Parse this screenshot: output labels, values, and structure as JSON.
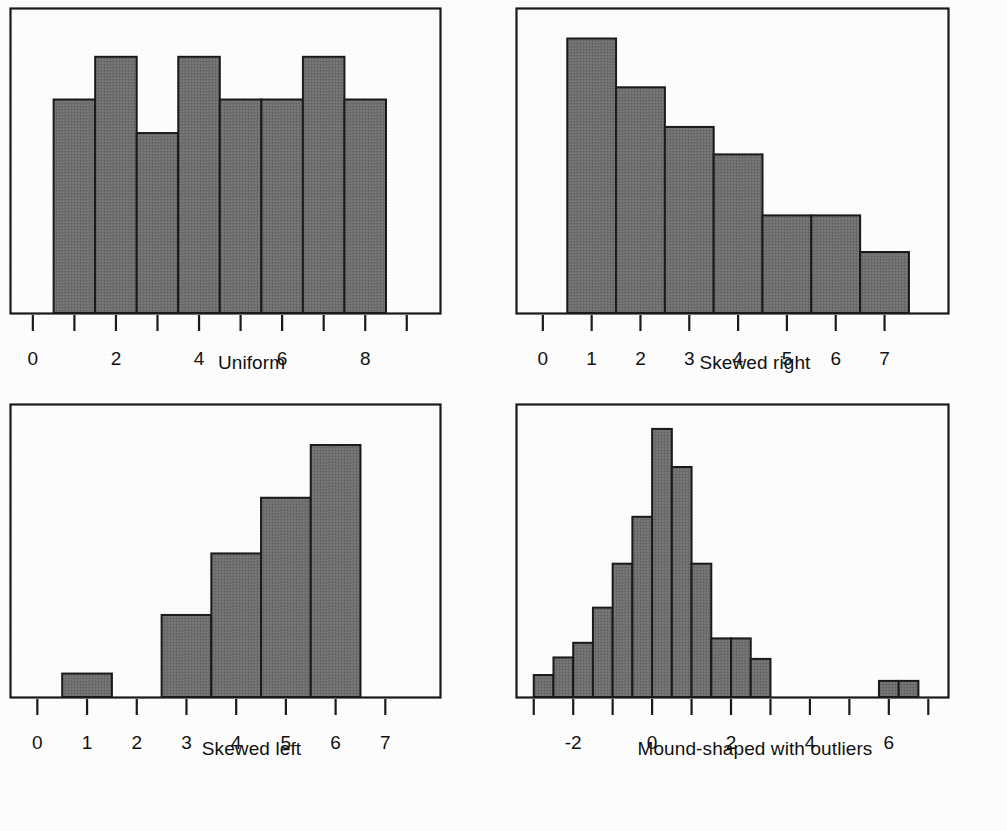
{
  "figure": {
    "background_color": "#fdfdfd",
    "bar_fill_color": "#6e6e6e",
    "bar_stroke_color": "#1a1a1a",
    "axis_color": "#1a1a1a"
  },
  "panels": [
    {
      "id": "uniform",
      "caption": "Uniform",
      "chart_data": {
        "type": "bar",
        "title": "Uniform",
        "xlabel": "Uniform",
        "ylabel": "",
        "xlim": [
          -0.55,
          9.8
        ],
        "ylim": [
          0,
          10
        ],
        "grid": false,
        "legend": "none",
        "bin_width": 1,
        "tick_values": [
          0,
          1,
          2,
          3,
          4,
          5,
          6,
          7,
          8,
          9
        ],
        "tick_labels": [
          "0",
          "",
          "2",
          "",
          "4",
          "",
          "6",
          "",
          "8",
          ""
        ],
        "bin_centers": [
          1,
          2,
          3,
          4,
          5,
          6,
          7,
          8
        ],
        "bin_edges": [
          0.5,
          1.5,
          2.5,
          3.5,
          4.5,
          5.5,
          6.5,
          7.5,
          8.5
        ],
        "values": [
          7.0,
          8.4,
          5.9,
          8.4,
          7.0,
          7.0,
          8.4,
          7.0
        ]
      }
    },
    {
      "id": "skewed-right",
      "caption": "Skewed right",
      "chart_data": {
        "type": "bar",
        "title": "Skewed right",
        "xlabel": "Skewed right",
        "ylabel": "",
        "xlim": [
          -0.55,
          8.3
        ],
        "ylim": [
          0,
          10
        ],
        "grid": false,
        "legend": "none",
        "bin_width": 1,
        "tick_values": [
          0,
          1,
          2,
          3,
          4,
          5,
          6,
          7
        ],
        "tick_labels": [
          "0",
          "1",
          "2",
          "3",
          "4",
          "5",
          "6",
          "7"
        ],
        "bin_centers": [
          1,
          2,
          3,
          4,
          5,
          6,
          7
        ],
        "bin_edges": [
          0.5,
          1.5,
          2.5,
          3.5,
          4.5,
          5.5,
          6.5,
          7.5
        ],
        "values": [
          9.0,
          7.4,
          6.1,
          5.2,
          3.2,
          3.2,
          2.0
        ]
      }
    },
    {
      "id": "skewed-left",
      "caption": "Skewed left",
      "chart_data": {
        "type": "bar",
        "title": "Skewed left",
        "xlabel": "Skewed left",
        "ylabel": "",
        "xlim": [
          -0.55,
          8.1
        ],
        "ylim": [
          0,
          10
        ],
        "grid": false,
        "legend": "none",
        "bin_width": 1,
        "tick_values": [
          0,
          1,
          2,
          3,
          4,
          5,
          6,
          7
        ],
        "tick_labels": [
          "0",
          "1",
          "2",
          "3",
          "4",
          "5",
          "6",
          "7"
        ],
        "bin_centers": [
          1,
          2,
          3,
          4,
          5,
          6
        ],
        "bin_edges": [
          0.5,
          1.5,
          2.5,
          3.5,
          4.5,
          5.5,
          6.5
        ],
        "values": [
          0.8,
          0.0,
          2.8,
          4.9,
          6.8,
          8.6
        ]
      }
    },
    {
      "id": "mound-shaped-with-outliers",
      "caption": "Mound-shaped with outliers",
      "chart_data": {
        "type": "bar",
        "title": "Mound-shaped with outliers",
        "xlabel": "Mound-shaped with outliers",
        "ylabel": "",
        "xlim": [
          -3.45,
          7.5
        ],
        "ylim": [
          0,
          10
        ],
        "grid": false,
        "legend": "none",
        "bin_width": 0.5,
        "tick_values": [
          -3,
          -2,
          -1,
          0,
          1,
          2,
          3,
          4,
          5,
          6,
          7
        ],
        "tick_labels": [
          "",
          "-2",
          "",
          "0",
          "",
          "2",
          "",
          "4",
          "",
          "6",
          ""
        ],
        "bin_centers": [
          -2.75,
          -2.25,
          -1.75,
          -1.25,
          -0.75,
          -0.25,
          0.25,
          0.75,
          1.25,
          1.75,
          2.25,
          2.75,
          6.0,
          6.5
        ],
        "bin_edges": [
          -3.0,
          -2.5,
          -2.0,
          -1.5,
          -1.0,
          -0.5,
          0.0,
          0.5,
          1.0,
          1.5,
          2.0,
          2.5,
          3.0
        ],
        "values": [
          0.75,
          1.35,
          1.85,
          3.05,
          4.55,
          6.15,
          9.15,
          7.85,
          4.55,
          2.0,
          2.0,
          1.3,
          0.55,
          0.55
        ],
        "outlier_bins": [
          {
            "edges": [
              5.75,
              6.25
            ],
            "value": 0.55
          },
          {
            "edges": [
              6.25,
              6.75
            ],
            "value": 0.55
          }
        ]
      }
    }
  ]
}
